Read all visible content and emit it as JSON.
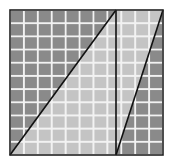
{
  "figure": {
    "grid": {
      "x0": 10,
      "y0": 10,
      "x1": 163,
      "y1": 155,
      "columns": 11,
      "rows": 11,
      "gap_color": "#f2f2f2"
    },
    "colors": {
      "dark_region": "#8a8a8a",
      "light_region": "#c4c4c4",
      "line": "#111111",
      "border": "#222222"
    },
    "lines": {
      "vertical_x": 116,
      "diagonal_1": {
        "x1": 10,
        "y1": 155,
        "x2": 116,
        "y2": 10
      },
      "diagonal_2": {
        "x1": 116,
        "y1": 155,
        "x2": 163,
        "y2": 10
      }
    },
    "regions": [
      {
        "name": "upper-left-triangle",
        "shade": "dark"
      },
      {
        "name": "lower-right-of-first-diagonal",
        "shade": "light"
      },
      {
        "name": "upper-left-of-second-diagonal",
        "shade": "light"
      },
      {
        "name": "lower-right-triangle",
        "shade": "dark"
      }
    ]
  }
}
